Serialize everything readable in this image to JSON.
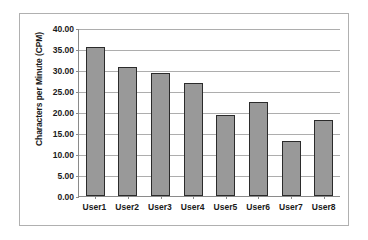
{
  "chart_data": {
    "type": "bar",
    "title": "",
    "xlabel": "",
    "ylabel": "Characters per Minute (CPM)",
    "categories": [
      "User1",
      "User2",
      "User3",
      "User4",
      "User5",
      "User6",
      "User7",
      "User8"
    ],
    "values": [
      35.5,
      30.7,
      29.2,
      27.0,
      19.3,
      22.3,
      13.2,
      18.0
    ],
    "ylim": [
      0,
      40
    ],
    "ytick_step": 5,
    "ytick_labels": [
      "40.00",
      "35.00",
      "30.00",
      "25.00",
      "20.00",
      "15.00",
      "10.00",
      "5.00",
      "0.00"
    ],
    "ytick_values": [
      40,
      35,
      30,
      25,
      20,
      15,
      10,
      5,
      0
    ],
    "grid": true,
    "legend": false,
    "colors": {
      "bar_fill": "#999999",
      "bar_border": "#2b2b2b",
      "gridline": "#adadad",
      "axis": "#8a8a8a",
      "frame_border": "#b0b0b0",
      "background": "#ffffff",
      "text": "#1a1a1a"
    }
  }
}
